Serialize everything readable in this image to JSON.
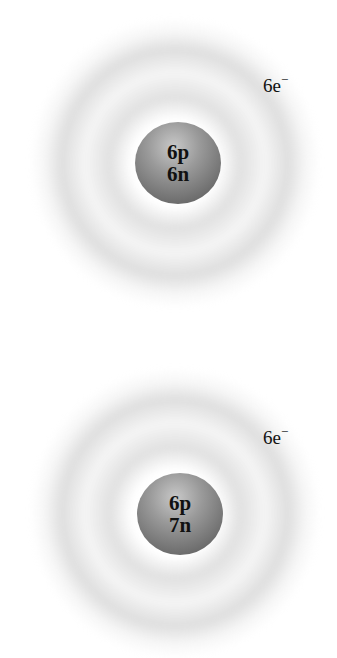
{
  "atoms": [
    {
      "protons": "6p",
      "neutrons": "6n",
      "electrons": "6e",
      "charge": "−"
    },
    {
      "protons": "6p",
      "neutrons": "7n",
      "electrons": "6e",
      "charge": "−"
    }
  ],
  "colors": {
    "nucleus": "#8a8a8a",
    "cloud": "#d0d0d0",
    "text": "#111111"
  }
}
